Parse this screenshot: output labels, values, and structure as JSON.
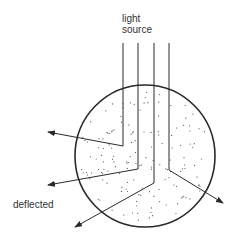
{
  "diagram": {
    "labels": {
      "source_line1": "light",
      "source_line2": "source",
      "deflected": "deflected"
    },
    "colors": {
      "stroke": "#2a2a2a",
      "dots": "#555555",
      "text": "#333333"
    },
    "circle": {
      "cx": 145,
      "cy": 156,
      "rx": 70,
      "ry": 71
    },
    "rays": [
      {
        "x": 123,
        "y_top": 43,
        "bend_y": 146,
        "tip": [
          48,
          132
        ]
      },
      {
        "x": 138,
        "y_top": 43,
        "bend_y": 169,
        "tip": [
          48,
          185
        ]
      },
      {
        "x": 154,
        "y_top": 43,
        "bend_y": 183,
        "tip": [
          75,
          227
        ]
      },
      {
        "x": 169,
        "y_top": 43,
        "bend_y": 170,
        "tip": [
          223,
          203
        ]
      }
    ]
  }
}
